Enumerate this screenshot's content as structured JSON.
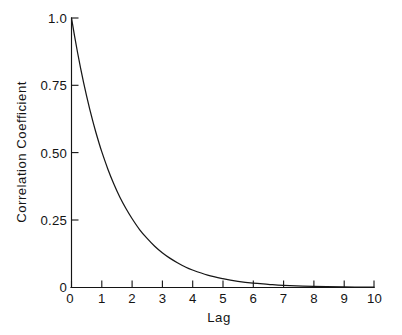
{
  "chart_data": {
    "type": "line",
    "title": "",
    "subtitle": "",
    "xlabel": "Lag",
    "ylabel": "Correlation Coefficient",
    "xlim": [
      0,
      10
    ],
    "ylim": [
      0,
      1.0
    ],
    "grid": false,
    "legend": null,
    "x_ticks": [
      0,
      1,
      2,
      3,
      4,
      5,
      6,
      7,
      8,
      9,
      10
    ],
    "x_tick_labels": [
      "0",
      "1",
      "2",
      "3",
      "4",
      "5",
      "6",
      "7",
      "8",
      "9",
      "10"
    ],
    "y_ticks": [
      0,
      0.25,
      0.5,
      0.75,
      1.0
    ],
    "y_tick_labels": [
      "0",
      "0.25",
      "0.50",
      "0.75",
      "1.0"
    ],
    "series": [
      {
        "name": "Autocorrelation",
        "color": "#171717",
        "x": [
          0,
          0.1,
          0.2,
          0.3,
          0.4,
          0.5,
          0.6,
          0.7,
          0.8,
          0.9,
          1.0,
          1.2,
          1.4,
          1.6,
          1.8,
          2.0,
          2.25,
          2.5,
          2.75,
          3.0,
          3.25,
          3.5,
          3.75,
          4.0,
          4.5,
          5.0,
          5.5,
          6.0,
          6.5,
          7.0,
          8.0,
          9.0,
          10.0
        ],
        "y": [
          1.0,
          0.934,
          0.872,
          0.814,
          0.76,
          0.71,
          0.663,
          0.619,
          0.578,
          0.54,
          0.504,
          0.44,
          0.384,
          0.335,
          0.293,
          0.256,
          0.215,
          0.182,
          0.153,
          0.129,
          0.109,
          0.092,
          0.077,
          0.065,
          0.046,
          0.033,
          0.023,
          0.016,
          0.012,
          0.008,
          0.004,
          0.002,
          0.001
        ]
      }
    ]
  },
  "axes": {
    "x_axis_name": "Lag",
    "y_axis_name": "Correlation Coefficient"
  }
}
